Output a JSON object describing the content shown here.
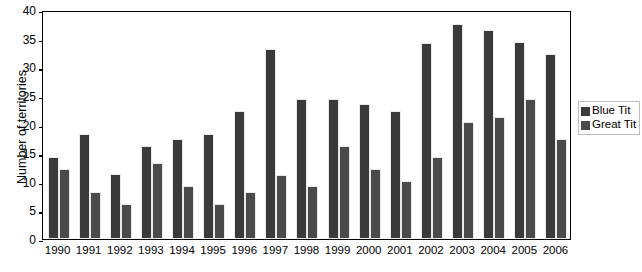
{
  "chart_data": {
    "type": "bar",
    "title": "",
    "subtitle": "",
    "xlabel": "",
    "ylabel": "Number of territories",
    "ylim": [
      0,
      40
    ],
    "ytick_values": [
      0,
      5,
      10,
      15,
      20,
      25,
      30,
      35,
      40
    ],
    "ytick_labels": [
      "0",
      "5",
      "10",
      "15",
      "20",
      "25",
      "30",
      "35",
      "40"
    ],
    "grid": false,
    "legend_position": "right",
    "categories": [
      "1990",
      "1991",
      "1992",
      "1993",
      "1994",
      "1995",
      "1996",
      "1997",
      "1998",
      "1999",
      "2000",
      "2001",
      "2002",
      "2003",
      "2004",
      "2005",
      "2006"
    ],
    "series": [
      {
        "name": "Blue Tit",
        "color": "#3a3a3a",
        "values": [
          14.3,
          18.4,
          11.3,
          16.3,
          17.4,
          18.4,
          22.4,
          33.2,
          24.5,
          24.5,
          23.5,
          22.4,
          34.3,
          37.5,
          36.5,
          34.5,
          32.3
        ]
      },
      {
        "name": "Great Tit",
        "color": "#4a4a4a",
        "values": [
          12.3,
          8.2,
          6.1,
          13.2,
          9.2,
          6.1,
          8.2,
          11.2,
          9.2,
          16.3,
          12.2,
          10.2,
          14.3,
          20.4,
          21.4,
          24.5,
          17.4
        ]
      }
    ]
  },
  "legend": {
    "entries": [
      {
        "label": "Blue Tit"
      },
      {
        "label": "Great Tit"
      }
    ]
  }
}
